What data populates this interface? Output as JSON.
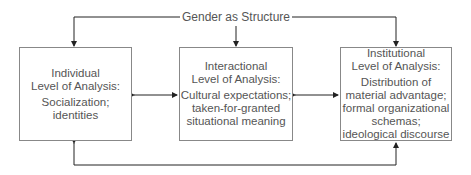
{
  "diagram": {
    "title": "Gender as Structure",
    "boxes": [
      {
        "heading": [
          "Individual",
          "Level of Analysis:"
        ],
        "body": [
          "Socialization;",
          "identities"
        ]
      },
      {
        "heading": [
          "Interactional",
          "Level of Analysis:"
        ],
        "body": [
          "Cultural expectations;",
          "taken-for-granted",
          "situational meaning"
        ]
      },
      {
        "heading": [
          "Institutional",
          "Level of Analysis:"
        ],
        "body": [
          "Distribution of",
          "material advantage;",
          "formal organizational",
          "schemas;",
          "ideological discourse"
        ]
      }
    ],
    "connections": [
      {
        "from": "title",
        "to": "individual",
        "type": "arrow"
      },
      {
        "from": "title",
        "to": "interactional",
        "type": "arrow"
      },
      {
        "from": "title",
        "to": "institutional",
        "type": "arrow"
      },
      {
        "from": "individual",
        "to": "interactional",
        "type": "bidirectional"
      },
      {
        "from": "interactional",
        "to": "institutional",
        "type": "bidirectional"
      },
      {
        "from": "individual",
        "to": "institutional",
        "type": "bidirectional-loop"
      }
    ]
  }
}
